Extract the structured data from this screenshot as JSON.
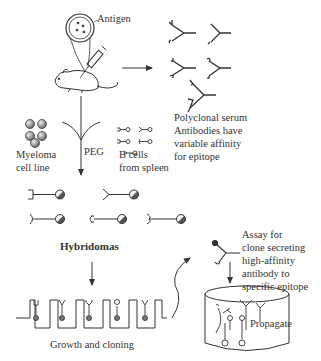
{
  "labels": {
    "antigen": "Antigen",
    "polyclonal_line1": "Polyclonal serum",
    "polyclonal_line2": "Antibodies have",
    "polyclonal_line3": "variable affinity",
    "polyclonal_line4": "for epitope",
    "myeloma_line1": "Myeloma",
    "myeloma_line2": "cell line",
    "peg": "PEG",
    "bcells_line1": "B cells",
    "bcells_line2": "from spleen",
    "hybridomas": "Hybridomas",
    "growth": "Growth and cloning",
    "assay_line1": "Assay for",
    "assay_line2": "clone secreting",
    "assay_line3": "high-affinity",
    "assay_line4": "antibody to",
    "assay_line5": "specific epitope",
    "propagate": "Propagate"
  },
  "colors": {
    "line": "#333333",
    "cell_fill": "#bbbbbb",
    "background": "#ffffff"
  }
}
